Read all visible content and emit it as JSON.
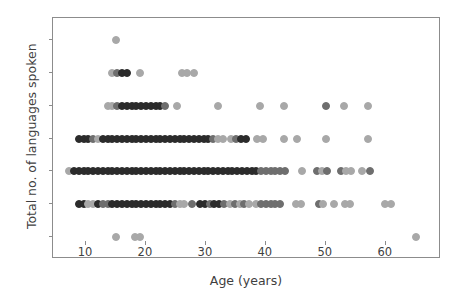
{
  "chart_data": {
    "type": "scatter",
    "title": "",
    "xlabel": "Age (years)",
    "ylabel": "Total no. of languages spoken",
    "xlim": [
      4.5,
      69.2
    ],
    "ylim": [
      0.33,
      7.67
    ],
    "xticks": [
      10,
      20,
      30,
      40,
      50,
      60
    ],
    "yticks": [
      1,
      2,
      3,
      4,
      5,
      6,
      7
    ],
    "xtick_labels": [
      "10",
      "20",
      "30",
      "40",
      "50",
      "60"
    ],
    "ytick_labels": [
      "1",
      "2",
      "3",
      "4",
      "5",
      "6",
      "7"
    ],
    "grid": false,
    "legend": null,
    "marker": "circle",
    "marker_size_px": 8,
    "marker_colors": {
      "dark": "#2b2b2b",
      "mid": "#6e6e6e",
      "light": "#a8a8a8",
      "pale": "#c9c9c9"
    },
    "axis_color": "#8c8c8c",
    "text_color": "#3f3f3f",
    "background": "#ffffff",
    "n_points": 263,
    "note": "Overlapping semi-transparent markers; darker dots indicate more overlapping observations at the same (age, languages) value.",
    "points": [
      {
        "x": 15,
        "y": 7,
        "shade": "light"
      },
      {
        "x": 14.4,
        "y": 6,
        "shade": "light"
      },
      {
        "x": 15.2,
        "y": 6,
        "shade": "mid"
      },
      {
        "x": 16.0,
        "y": 6,
        "shade": "dark"
      },
      {
        "x": 16.8,
        "y": 6,
        "shade": "dark"
      },
      {
        "x": 19.0,
        "y": 6,
        "shade": "light"
      },
      {
        "x": 26.0,
        "y": 6,
        "shade": "light"
      },
      {
        "x": 26.8,
        "y": 6,
        "shade": "light"
      },
      {
        "x": 28.0,
        "y": 6,
        "shade": "light"
      },
      {
        "x": 13.6,
        "y": 5,
        "shade": "light"
      },
      {
        "x": 14.4,
        "y": 5,
        "shade": "light"
      },
      {
        "x": 15.2,
        "y": 5,
        "shade": "mid"
      },
      {
        "x": 16.0,
        "y": 5,
        "shade": "dark"
      },
      {
        "x": 16.8,
        "y": 5,
        "shade": "dark"
      },
      {
        "x": 17.6,
        "y": 5,
        "shade": "dark"
      },
      {
        "x": 18.4,
        "y": 5,
        "shade": "dark"
      },
      {
        "x": 19.2,
        "y": 5,
        "shade": "dark"
      },
      {
        "x": 20.0,
        "y": 5,
        "shade": "dark"
      },
      {
        "x": 20.8,
        "y": 5,
        "shade": "dark"
      },
      {
        "x": 21.6,
        "y": 5,
        "shade": "dark"
      },
      {
        "x": 22.4,
        "y": 5,
        "shade": "dark"
      },
      {
        "x": 23.2,
        "y": 5,
        "shade": "mid"
      },
      {
        "x": 25.2,
        "y": 5,
        "shade": "light"
      },
      {
        "x": 32.0,
        "y": 5,
        "shade": "light"
      },
      {
        "x": 39.0,
        "y": 5,
        "shade": "light"
      },
      {
        "x": 43.0,
        "y": 5,
        "shade": "light"
      },
      {
        "x": 50.0,
        "y": 5,
        "shade": "mid"
      },
      {
        "x": 53.0,
        "y": 5,
        "shade": "light"
      },
      {
        "x": 57.0,
        "y": 5,
        "shade": "light"
      },
      {
        "x": 8.8,
        "y": 4,
        "shade": "dark"
      },
      {
        "x": 9.6,
        "y": 4,
        "shade": "dark"
      },
      {
        "x": 10.4,
        "y": 4,
        "shade": "dark"
      },
      {
        "x": 11.2,
        "y": 4,
        "shade": "mid"
      },
      {
        "x": 12.0,
        "y": 4,
        "shade": "light"
      },
      {
        "x": 12.8,
        "y": 4,
        "shade": "dark"
      },
      {
        "x": 13.6,
        "y": 4,
        "shade": "dark"
      },
      {
        "x": 14.4,
        "y": 4,
        "shade": "dark"
      },
      {
        "x": 15.2,
        "y": 4,
        "shade": "dark"
      },
      {
        "x": 16.0,
        "y": 4,
        "shade": "dark"
      },
      {
        "x": 16.8,
        "y": 4,
        "shade": "dark"
      },
      {
        "x": 17.6,
        "y": 4,
        "shade": "dark"
      },
      {
        "x": 18.4,
        "y": 4,
        "shade": "dark"
      },
      {
        "x": 19.2,
        "y": 4,
        "shade": "dark"
      },
      {
        "x": 20.0,
        "y": 4,
        "shade": "dark"
      },
      {
        "x": 20.8,
        "y": 4,
        "shade": "dark"
      },
      {
        "x": 21.6,
        "y": 4,
        "shade": "dark"
      },
      {
        "x": 22.4,
        "y": 4,
        "shade": "dark"
      },
      {
        "x": 23.2,
        "y": 4,
        "shade": "dark"
      },
      {
        "x": 24.0,
        "y": 4,
        "shade": "dark"
      },
      {
        "x": 24.8,
        "y": 4,
        "shade": "dark"
      },
      {
        "x": 25.6,
        "y": 4,
        "shade": "dark"
      },
      {
        "x": 26.4,
        "y": 4,
        "shade": "dark"
      },
      {
        "x": 27.2,
        "y": 4,
        "shade": "dark"
      },
      {
        "x": 28.0,
        "y": 4,
        "shade": "dark"
      },
      {
        "x": 28.8,
        "y": 4,
        "shade": "dark"
      },
      {
        "x": 29.6,
        "y": 4,
        "shade": "dark"
      },
      {
        "x": 30.4,
        "y": 4,
        "shade": "dark"
      },
      {
        "x": 31.2,
        "y": 4,
        "shade": "mid"
      },
      {
        "x": 32.0,
        "y": 4,
        "shade": "light"
      },
      {
        "x": 32.8,
        "y": 4,
        "shade": "light"
      },
      {
        "x": 34.2,
        "y": 4,
        "shade": "light"
      },
      {
        "x": 35.0,
        "y": 4,
        "shade": "mid"
      },
      {
        "x": 35.8,
        "y": 4,
        "shade": "dark"
      },
      {
        "x": 36.6,
        "y": 4,
        "shade": "dark"
      },
      {
        "x": 38.6,
        "y": 4,
        "shade": "light"
      },
      {
        "x": 39.6,
        "y": 4,
        "shade": "light"
      },
      {
        "x": 43.0,
        "y": 4,
        "shade": "light"
      },
      {
        "x": 45.2,
        "y": 4,
        "shade": "light"
      },
      {
        "x": 50.0,
        "y": 4,
        "shade": "light"
      },
      {
        "x": 57.0,
        "y": 4,
        "shade": "light"
      },
      {
        "x": 7.2,
        "y": 3,
        "shade": "light"
      },
      {
        "x": 8.0,
        "y": 3,
        "shade": "dark"
      },
      {
        "x": 8.8,
        "y": 3,
        "shade": "dark"
      },
      {
        "x": 9.6,
        "y": 3,
        "shade": "dark"
      },
      {
        "x": 10.4,
        "y": 3,
        "shade": "dark"
      },
      {
        "x": 11.2,
        "y": 3,
        "shade": "dark"
      },
      {
        "x": 12.0,
        "y": 3,
        "shade": "dark"
      },
      {
        "x": 12.8,
        "y": 3,
        "shade": "dark"
      },
      {
        "x": 13.6,
        "y": 3,
        "shade": "dark"
      },
      {
        "x": 14.4,
        "y": 3,
        "shade": "dark"
      },
      {
        "x": 15.2,
        "y": 3,
        "shade": "dark"
      },
      {
        "x": 16.0,
        "y": 3,
        "shade": "dark"
      },
      {
        "x": 16.8,
        "y": 3,
        "shade": "dark"
      },
      {
        "x": 17.6,
        "y": 3,
        "shade": "dark"
      },
      {
        "x": 18.4,
        "y": 3,
        "shade": "dark"
      },
      {
        "x": 19.2,
        "y": 3,
        "shade": "dark"
      },
      {
        "x": 20.0,
        "y": 3,
        "shade": "dark"
      },
      {
        "x": 20.8,
        "y": 3,
        "shade": "dark"
      },
      {
        "x": 21.6,
        "y": 3,
        "shade": "dark"
      },
      {
        "x": 22.4,
        "y": 3,
        "shade": "dark"
      },
      {
        "x": 23.2,
        "y": 3,
        "shade": "dark"
      },
      {
        "x": 24.0,
        "y": 3,
        "shade": "dark"
      },
      {
        "x": 24.8,
        "y": 3,
        "shade": "dark"
      },
      {
        "x": 25.6,
        "y": 3,
        "shade": "dark"
      },
      {
        "x": 26.4,
        "y": 3,
        "shade": "dark"
      },
      {
        "x": 27.2,
        "y": 3,
        "shade": "dark"
      },
      {
        "x": 28.0,
        "y": 3,
        "shade": "dark"
      },
      {
        "x": 28.8,
        "y": 3,
        "shade": "dark"
      },
      {
        "x": 29.6,
        "y": 3,
        "shade": "dark"
      },
      {
        "x": 30.4,
        "y": 3,
        "shade": "dark"
      },
      {
        "x": 31.2,
        "y": 3,
        "shade": "dark"
      },
      {
        "x": 32.0,
        "y": 3,
        "shade": "dark"
      },
      {
        "x": 32.8,
        "y": 3,
        "shade": "dark"
      },
      {
        "x": 33.6,
        "y": 3,
        "shade": "dark"
      },
      {
        "x": 34.4,
        "y": 3,
        "shade": "dark"
      },
      {
        "x": 35.2,
        "y": 3,
        "shade": "dark"
      },
      {
        "x": 36.0,
        "y": 3,
        "shade": "dark"
      },
      {
        "x": 36.8,
        "y": 3,
        "shade": "dark"
      },
      {
        "x": 37.6,
        "y": 3,
        "shade": "dark"
      },
      {
        "x": 38.4,
        "y": 3,
        "shade": "dark"
      },
      {
        "x": 39.2,
        "y": 3,
        "shade": "mid"
      },
      {
        "x": 40.0,
        "y": 3,
        "shade": "mid"
      },
      {
        "x": 40.8,
        "y": 3,
        "shade": "mid"
      },
      {
        "x": 41.6,
        "y": 3,
        "shade": "mid"
      },
      {
        "x": 42.4,
        "y": 3,
        "shade": "mid"
      },
      {
        "x": 43.2,
        "y": 3,
        "shade": "mid"
      },
      {
        "x": 46.0,
        "y": 3,
        "shade": "light"
      },
      {
        "x": 48.6,
        "y": 3,
        "shade": "mid"
      },
      {
        "x": 49.4,
        "y": 3,
        "shade": "light"
      },
      {
        "x": 50.2,
        "y": 3,
        "shade": "mid"
      },
      {
        "x": 52.6,
        "y": 3,
        "shade": "mid"
      },
      {
        "x": 53.4,
        "y": 3,
        "shade": "light"
      },
      {
        "x": 54.2,
        "y": 3,
        "shade": "light"
      },
      {
        "x": 56.0,
        "y": 3,
        "shade": "light"
      },
      {
        "x": 57.4,
        "y": 3,
        "shade": "mid"
      },
      {
        "x": 8.8,
        "y": 2,
        "shade": "dark"
      },
      {
        "x": 9.6,
        "y": 2,
        "shade": "dark"
      },
      {
        "x": 10.4,
        "y": 2,
        "shade": "light"
      },
      {
        "x": 11.2,
        "y": 2,
        "shade": "light"
      },
      {
        "x": 12.0,
        "y": 2,
        "shade": "dark"
      },
      {
        "x": 12.8,
        "y": 2,
        "shade": "mid"
      },
      {
        "x": 13.6,
        "y": 2,
        "shade": "mid"
      },
      {
        "x": 14.4,
        "y": 2,
        "shade": "dark"
      },
      {
        "x": 15.2,
        "y": 2,
        "shade": "dark"
      },
      {
        "x": 16.0,
        "y": 2,
        "shade": "dark"
      },
      {
        "x": 16.8,
        "y": 2,
        "shade": "dark"
      },
      {
        "x": 17.6,
        "y": 2,
        "shade": "dark"
      },
      {
        "x": 18.4,
        "y": 2,
        "shade": "dark"
      },
      {
        "x": 19.2,
        "y": 2,
        "shade": "dark"
      },
      {
        "x": 20.0,
        "y": 2,
        "shade": "dark"
      },
      {
        "x": 20.8,
        "y": 2,
        "shade": "dark"
      },
      {
        "x": 21.6,
        "y": 2,
        "shade": "dark"
      },
      {
        "x": 22.4,
        "y": 2,
        "shade": "dark"
      },
      {
        "x": 23.2,
        "y": 2,
        "shade": "dark"
      },
      {
        "x": 24.0,
        "y": 2,
        "shade": "dark"
      },
      {
        "x": 24.8,
        "y": 2,
        "shade": "mid"
      },
      {
        "x": 25.6,
        "y": 2,
        "shade": "light"
      },
      {
        "x": 26.4,
        "y": 2,
        "shade": "light"
      },
      {
        "x": 27.6,
        "y": 2,
        "shade": "mid"
      },
      {
        "x": 29.0,
        "y": 2,
        "shade": "dark"
      },
      {
        "x": 29.8,
        "y": 2,
        "shade": "dark"
      },
      {
        "x": 30.6,
        "y": 2,
        "shade": "mid"
      },
      {
        "x": 31.4,
        "y": 2,
        "shade": "dark"
      },
      {
        "x": 32.2,
        "y": 2,
        "shade": "dark"
      },
      {
        "x": 33.0,
        "y": 2,
        "shade": "mid"
      },
      {
        "x": 34.0,
        "y": 2,
        "shade": "light"
      },
      {
        "x": 34.8,
        "y": 2,
        "shade": "mid"
      },
      {
        "x": 35.6,
        "y": 2,
        "shade": "light"
      },
      {
        "x": 36.4,
        "y": 2,
        "shade": "mid"
      },
      {
        "x": 37.2,
        "y": 2,
        "shade": "light"
      },
      {
        "x": 38.4,
        "y": 2,
        "shade": "light"
      },
      {
        "x": 39.2,
        "y": 2,
        "shade": "mid"
      },
      {
        "x": 40.0,
        "y": 2,
        "shade": "mid"
      },
      {
        "x": 40.8,
        "y": 2,
        "shade": "mid"
      },
      {
        "x": 41.6,
        "y": 2,
        "shade": "mid"
      },
      {
        "x": 42.4,
        "y": 2,
        "shade": "mid"
      },
      {
        "x": 45.0,
        "y": 2,
        "shade": "light"
      },
      {
        "x": 45.8,
        "y": 2,
        "shade": "light"
      },
      {
        "x": 48.8,
        "y": 2,
        "shade": "mid"
      },
      {
        "x": 49.6,
        "y": 2,
        "shade": "light"
      },
      {
        "x": 51.4,
        "y": 2,
        "shade": "light"
      },
      {
        "x": 53.2,
        "y": 2,
        "shade": "light"
      },
      {
        "x": 54.0,
        "y": 2,
        "shade": "light"
      },
      {
        "x": 59.8,
        "y": 2,
        "shade": "light"
      },
      {
        "x": 60.8,
        "y": 2,
        "shade": "light"
      },
      {
        "x": 15.0,
        "y": 1,
        "shade": "light"
      },
      {
        "x": 18.2,
        "y": 1,
        "shade": "light"
      },
      {
        "x": 19.0,
        "y": 1,
        "shade": "light"
      },
      {
        "x": 65.0,
        "y": 1,
        "shade": "light"
      }
    ]
  }
}
